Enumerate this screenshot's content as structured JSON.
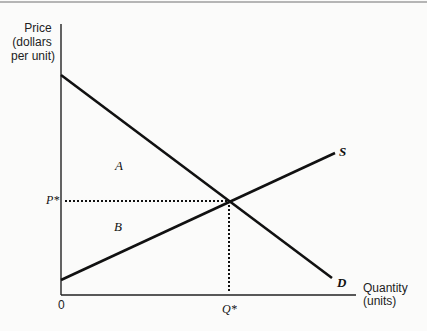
{
  "diagram": {
    "type": "supply-demand",
    "y_axis_label": [
      "Price",
      "(dollars",
      "per unit)"
    ],
    "x_axis_label": [
      "Quantity",
      "(units)"
    ],
    "origin_label": "0",
    "curves": {
      "demand": {
        "label": "D"
      },
      "supply": {
        "label": "S"
      }
    },
    "regions": {
      "consumer_surplus": "A",
      "producer_surplus": "B"
    },
    "equilibrium": {
      "price_label": "P*",
      "quantity_label": "Q*"
    },
    "colors": {
      "line": "#111111",
      "background": "#fbfbfa"
    }
  }
}
